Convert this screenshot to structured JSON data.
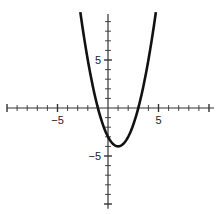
{
  "chart_data": {
    "type": "line",
    "title": "",
    "xlabel": "",
    "ylabel": "",
    "function": "y = x^2 - 2x - 3",
    "series": [
      {
        "name": "parabola",
        "x": [
          -2.74,
          -2,
          -1,
          0,
          1,
          2,
          3,
          4,
          4.74
        ],
        "values": [
          10,
          5,
          0,
          -3,
          -4,
          -3,
          0,
          5,
          10
        ]
      }
    ],
    "vertex": [
      1,
      -4
    ],
    "x_intercepts": [
      -1,
      3
    ],
    "xlim": [
      -10,
      10.5
    ],
    "ylim": [
      -10.5,
      9.8
    ],
    "x_tick_labels": [
      {
        "value": -5,
        "text": "−5"
      },
      {
        "value": 5,
        "text": "5"
      }
    ],
    "y_tick_labels": [
      {
        "value": 5,
        "text": "5"
      },
      {
        "value": -5,
        "text": "−5"
      }
    ],
    "tick_step": 1,
    "grid": false,
    "legend": null,
    "colors": {
      "curve": "#111111",
      "axis": "#333333"
    }
  }
}
